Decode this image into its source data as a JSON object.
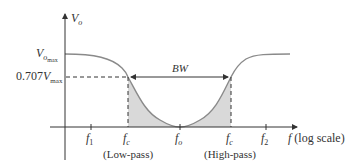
{
  "diagram": {
    "type": "band-stop filter frequency response",
    "y_axis": {
      "label": "V",
      "label_sub": "o"
    },
    "x_axis": {
      "label": "f",
      "label_suffix": "(log scale)"
    },
    "levels": {
      "vmax": {
        "label": "V",
        "label_sub": "o",
        "label_subsub": "max"
      },
      "v707": {
        "prefix": "0.707",
        "label": "V",
        "label_sub": "max"
      }
    },
    "bandwidth_label": "BW",
    "ticks": [
      {
        "name": "f1",
        "main": "f",
        "sub": "1"
      },
      {
        "name": "fc-low",
        "main": "f",
        "sub": "c"
      },
      {
        "name": "fo",
        "main": "f",
        "sub": "o"
      },
      {
        "name": "fc-high",
        "main": "f",
        "sub": "c"
      },
      {
        "name": "f2",
        "main": "f",
        "sub": "2"
      }
    ],
    "captions": {
      "low": "(Low-pass)",
      "high": "(High-pass)"
    },
    "colors": {
      "curve": "#8a8a8a",
      "fill": "#d9d9d9",
      "axis": "#333333",
      "dash": "#333333"
    }
  }
}
